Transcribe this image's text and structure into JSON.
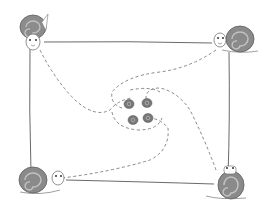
{
  "illustration": {
    "description": "Four snails at the corners of a rectangle, each crawling along a dashed spiral path toward the center, where four small snails meet.",
    "colors": {
      "line": "#666666",
      "dash": "#777777",
      "shell_dark": "#7a7a7a",
      "shell_mid": "#9a9a9a",
      "shell_light": "#c4c4c4",
      "body": "#ffffff"
    },
    "rectangle": {
      "x1": 44,
      "y1": 42,
      "x2": 229,
      "y2": 180
    },
    "snails": [
      {
        "position": "top-left",
        "x": 32,
        "y": 28
      },
      {
        "position": "top-right",
        "x": 232,
        "y": 38
      },
      {
        "position": "bottom-left",
        "x": 32,
        "y": 182
      },
      {
        "position": "bottom-right",
        "x": 231,
        "y": 186
      }
    ],
    "center_snails": 4
  }
}
